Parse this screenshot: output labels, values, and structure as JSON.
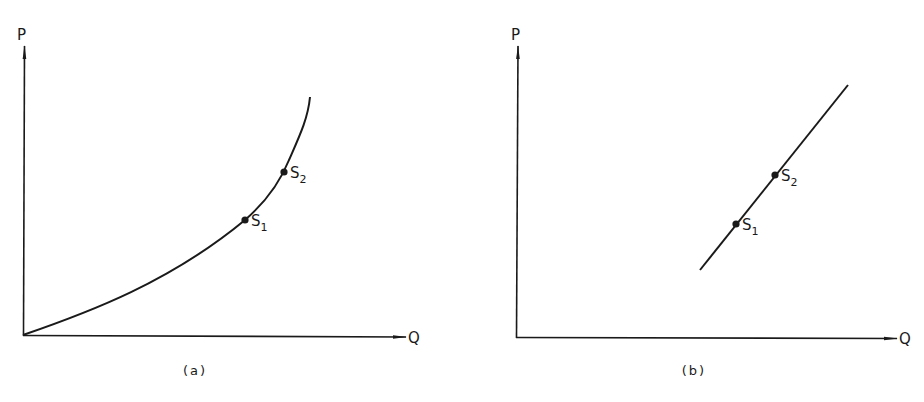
{
  "figure": {
    "panels": [
      {
        "id": "a",
        "label": "(a)",
        "y_axis_label": "P",
        "x_axis_label": "Q",
        "curve_type": "convex curve from origin, steepening upward",
        "points": [
          {
            "name": "S",
            "sub": "1"
          },
          {
            "name": "S",
            "sub": "2"
          }
        ]
      },
      {
        "id": "b",
        "label": "(b)",
        "y_axis_label": "P",
        "x_axis_label": "Q",
        "curve_type": "straight line with positive slope",
        "points": [
          {
            "name": "S",
            "sub": "1"
          },
          {
            "name": "S",
            "sub": "2"
          }
        ]
      }
    ],
    "caption": ""
  },
  "colors": {
    "ink": "#1a1a1a",
    "background": "#ffffff"
  }
}
